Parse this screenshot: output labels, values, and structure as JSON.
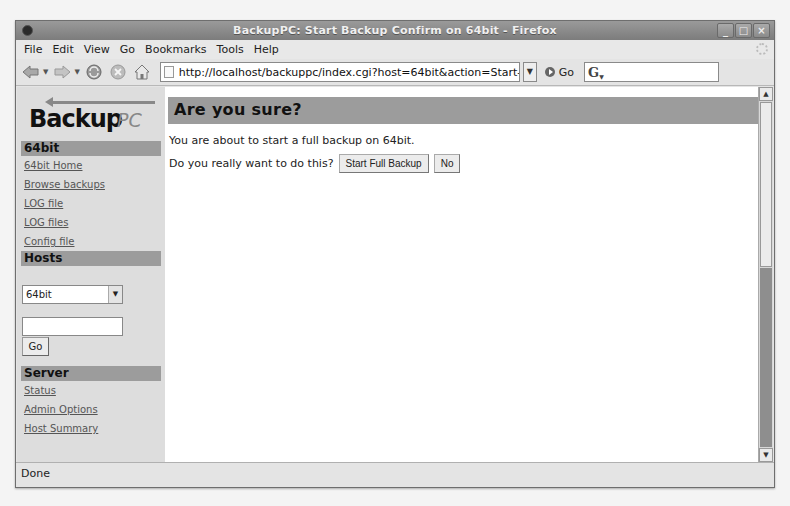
{
  "window": {
    "title": "BackupPC: Start Backup Confirm on 64bit - Firefox",
    "controls": [
      "minimize",
      "maximize",
      "close"
    ]
  },
  "menubar": {
    "items": [
      "File",
      "Edit",
      "View",
      "Go",
      "Bookmarks",
      "Tools",
      "Help"
    ]
  },
  "navbar": {
    "url": "http://localhost/backuppc/index.cgi?host=64bit&action=Start-",
    "go_label": "Go",
    "search_value": ""
  },
  "sidebar": {
    "logo_main": "Backup",
    "logo_suffix": "PC",
    "host_section": {
      "title": "64bit",
      "links": [
        "64bit Home",
        "Browse backups",
        "LOG file",
        "LOG files",
        "Config file"
      ]
    },
    "hosts_section": {
      "title": "Hosts",
      "selected_host": "64bit",
      "input_value": "",
      "go_label": "Go"
    },
    "server_section": {
      "title": "Server",
      "links": [
        "Status",
        "Admin Options",
        "Host Summary"
      ]
    }
  },
  "main": {
    "heading": "Are you sure?",
    "message": "You are about to start a full backup on 64bit.",
    "question": "Do you really want to do this?",
    "confirm_button": "Start Full Backup",
    "cancel_button": "No"
  },
  "statusbar": {
    "text": "Done"
  },
  "colors": {
    "header_bg": "#9c9c9c",
    "sidebar_bg": "#dddddd",
    "link": "#555555"
  }
}
